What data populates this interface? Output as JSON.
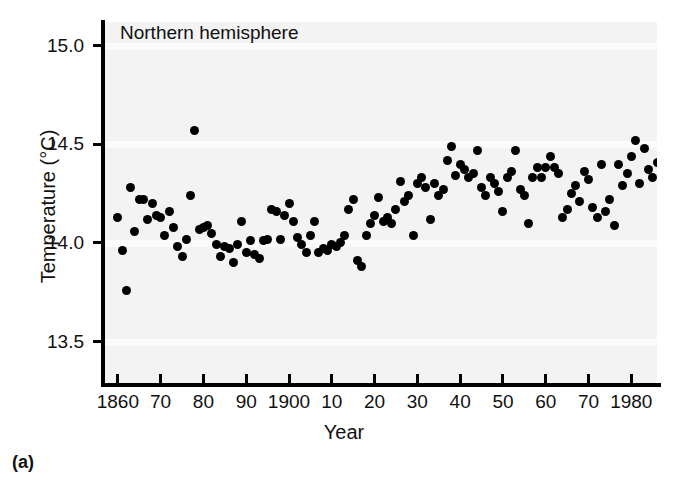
{
  "panel_label": "(a)",
  "chart_data": {
    "type": "scatter",
    "title": "Northern hemisphere",
    "xlabel": "Year",
    "ylabel": "Temperature (°C)",
    "xlim": [
      1857,
      1986
    ],
    "ylim": [
      13.28,
      15.12
    ],
    "grid": false,
    "legend": null,
    "x_tick_values": [
      1860,
      1870,
      1880,
      1890,
      1900,
      1910,
      1920,
      1930,
      1940,
      1950,
      1960,
      1970,
      1980
    ],
    "x_tick_labels": [
      "1860",
      "70",
      "80",
      "90",
      "1900",
      "10",
      "20",
      "30",
      "40",
      "50",
      "60",
      "70",
      "1980"
    ],
    "y_tick_values": [
      13.5,
      14.0,
      14.5,
      15.0
    ],
    "y_tick_labels": [
      "13.5",
      "14.0",
      "14.5",
      "15.0"
    ],
    "marker": "filled-circle",
    "marker_color": "#000000",
    "plot_background": "#f3f3f3",
    "series": [
      {
        "name": "Northern hemisphere annual mean temperature",
        "points": [
          [
            1860,
            14.13
          ],
          [
            1861,
            13.96
          ],
          [
            1862,
            13.76
          ],
          [
            1863,
            14.28
          ],
          [
            1864,
            14.06
          ],
          [
            1865,
            14.22
          ],
          [
            1866,
            14.22
          ],
          [
            1867,
            14.12
          ],
          [
            1868,
            14.2
          ],
          [
            1869,
            14.14
          ],
          [
            1870,
            14.13
          ],
          [
            1871,
            14.04
          ],
          [
            1872,
            14.16
          ],
          [
            1873,
            14.08
          ],
          [
            1874,
            13.98
          ],
          [
            1875,
            13.93
          ],
          [
            1876,
            14.02
          ],
          [
            1877,
            14.24
          ],
          [
            1878,
            14.57
          ],
          [
            1879,
            14.07
          ],
          [
            1880,
            14.08
          ],
          [
            1881,
            14.09
          ],
          [
            1882,
            14.05
          ],
          [
            1883,
            13.99
          ],
          [
            1884,
            13.93
          ],
          [
            1885,
            13.98
          ],
          [
            1886,
            13.97
          ],
          [
            1887,
            13.9
          ],
          [
            1888,
            13.99
          ],
          [
            1889,
            14.11
          ],
          [
            1890,
            13.95
          ],
          [
            1891,
            14.01
          ],
          [
            1892,
            13.94
          ],
          [
            1893,
            13.92
          ],
          [
            1894,
            14.01
          ],
          [
            1895,
            14.02
          ],
          [
            1896,
            14.17
          ],
          [
            1897,
            14.16
          ],
          [
            1898,
            14.02
          ],
          [
            1899,
            14.14
          ],
          [
            1900,
            14.2
          ],
          [
            1901,
            14.11
          ],
          [
            1902,
            14.03
          ],
          [
            1903,
            13.99
          ],
          [
            1904,
            13.95
          ],
          [
            1905,
            14.04
          ],
          [
            1906,
            14.11
          ],
          [
            1907,
            13.95
          ],
          [
            1908,
            13.97
          ],
          [
            1909,
            13.96
          ],
          [
            1910,
            13.99
          ],
          [
            1911,
            13.98
          ],
          [
            1912,
            14.0
          ],
          [
            1913,
            14.04
          ],
          [
            1914,
            14.17
          ],
          [
            1915,
            14.22
          ],
          [
            1916,
            13.91
          ],
          [
            1917,
            13.88
          ],
          [
            1918,
            14.04
          ],
          [
            1919,
            14.1
          ],
          [
            1920,
            14.14
          ],
          [
            1921,
            14.23
          ],
          [
            1922,
            14.11
          ],
          [
            1923,
            14.13
          ],
          [
            1924,
            14.1
          ],
          [
            1925,
            14.17
          ],
          [
            1926,
            14.31
          ],
          [
            1927,
            14.21
          ],
          [
            1928,
            14.24
          ],
          [
            1929,
            14.04
          ],
          [
            1930,
            14.3
          ],
          [
            1931,
            14.33
          ],
          [
            1932,
            14.28
          ],
          [
            1933,
            14.12
          ],
          [
            1934,
            14.3
          ],
          [
            1935,
            14.24
          ],
          [
            1936,
            14.27
          ],
          [
            1937,
            14.42
          ],
          [
            1938,
            14.49
          ],
          [
            1939,
            14.34
          ],
          [
            1940,
            14.4
          ],
          [
            1941,
            14.37
          ],
          [
            1942,
            14.33
          ],
          [
            1943,
            14.35
          ],
          [
            1944,
            14.47
          ],
          [
            1945,
            14.28
          ],
          [
            1946,
            14.24
          ],
          [
            1947,
            14.33
          ],
          [
            1948,
            14.3
          ],
          [
            1949,
            14.26
          ],
          [
            1950,
            14.16
          ],
          [
            1951,
            14.33
          ],
          [
            1952,
            14.36
          ],
          [
            1953,
            14.47
          ],
          [
            1954,
            14.27
          ],
          [
            1955,
            14.24
          ],
          [
            1956,
            14.1
          ],
          [
            1957,
            14.33
          ],
          [
            1958,
            14.38
          ],
          [
            1959,
            14.33
          ],
          [
            1960,
            14.38
          ],
          [
            1961,
            14.44
          ],
          [
            1962,
            14.38
          ],
          [
            1963,
            14.35
          ],
          [
            1964,
            14.13
          ],
          [
            1965,
            14.17
          ],
          [
            1966,
            14.25
          ],
          [
            1967,
            14.29
          ],
          [
            1968,
            14.21
          ],
          [
            1969,
            14.36
          ],
          [
            1970,
            14.32
          ],
          [
            1971,
            14.18
          ],
          [
            1972,
            14.13
          ],
          [
            1973,
            14.4
          ],
          [
            1974,
            14.16
          ],
          [
            1975,
            14.22
          ],
          [
            1976,
            14.09
          ],
          [
            1977,
            14.4
          ],
          [
            1978,
            14.29
          ],
          [
            1979,
            14.35
          ],
          [
            1980,
            14.44
          ],
          [
            1981,
            14.52
          ],
          [
            1982,
            14.3
          ],
          [
            1983,
            14.48
          ],
          [
            1984,
            14.37
          ],
          [
            1985,
            14.33
          ],
          [
            1986,
            14.41
          ]
        ]
      }
    ]
  }
}
